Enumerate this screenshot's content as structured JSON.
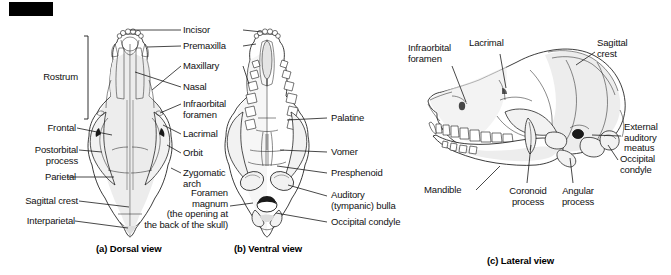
{
  "figure": {
    "panels": [
      {
        "id": "a",
        "caption": "(a) Dorsal view"
      },
      {
        "id": "b",
        "caption": "(b) Ventral view"
      },
      {
        "id": "c",
        "caption": "(c) Lateral view"
      }
    ]
  },
  "labels_dorsal_left": [
    {
      "id": "rostrum",
      "text": "Rostrum"
    },
    {
      "id": "frontal",
      "text": "Frontal"
    },
    {
      "id": "postorbital_process",
      "text": "Postorbital\nprocess"
    },
    {
      "id": "parietal",
      "text": "Parietal"
    },
    {
      "id": "sagittal_crest",
      "text": "Sagittal crest"
    },
    {
      "id": "interparietal",
      "text": "Interparietal"
    }
  ],
  "labels_center": [
    {
      "id": "incisor",
      "text": "Incisor"
    },
    {
      "id": "premaxilla",
      "text": "Premaxilla"
    },
    {
      "id": "maxillary",
      "text": "Maxillary"
    },
    {
      "id": "nasal",
      "text": "Nasal"
    },
    {
      "id": "infraorbital_foramen",
      "text": "Infraorbital\nforamen"
    },
    {
      "id": "lacrimal",
      "text": "Lacrimal"
    },
    {
      "id": "orbit",
      "text": "Orbit"
    },
    {
      "id": "zygomatic_arch",
      "text": "Zygomatic\narch"
    },
    {
      "id": "foramen_magnum",
      "text": "Foramen\nmagnum\n(the opening at\nthe back of the skull)"
    }
  ],
  "labels_ventral_right": [
    {
      "id": "palatine",
      "text": "Palatine"
    },
    {
      "id": "vomer",
      "text": "Vomer"
    },
    {
      "id": "presphenoid",
      "text": "Presphenoid"
    },
    {
      "id": "auditory_bulla",
      "text": "Auditory\n(tympanic) bulla"
    },
    {
      "id": "occipital_condyle_ventral",
      "text": "Occipital condyle"
    }
  ],
  "labels_lateral": [
    {
      "id": "infraorbital_foramen_lateral",
      "text": "Infraorbital\nforamen"
    },
    {
      "id": "lacrimal_lateral",
      "text": "Lacrimal"
    },
    {
      "id": "sagittal_crest_lateral",
      "text": "Sagittal\ncrest"
    },
    {
      "id": "external_auditory_meatus",
      "text": "External\nauditory\nmeatus"
    },
    {
      "id": "occipital_condyle_lateral",
      "text": "Occipital\ncondyle"
    },
    {
      "id": "mandible",
      "text": "Mandible"
    },
    {
      "id": "coronoid_process",
      "text": "Coronoid\nprocess"
    },
    {
      "id": "angular_process",
      "text": "Angular\nprocess"
    }
  ],
  "colors": {
    "ink": "#1a1a1a",
    "background": "#ffffff",
    "redaction": "#000000"
  }
}
